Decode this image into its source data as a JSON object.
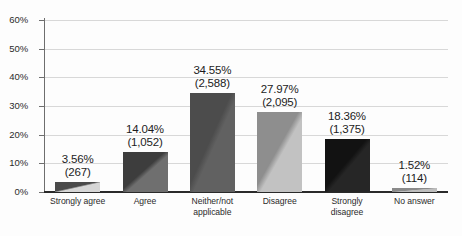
{
  "chart_data": {
    "type": "bar",
    "title": "",
    "subtitle": "",
    "xlabel": "",
    "ylabel": "",
    "ylim": [
      0,
      60
    ],
    "y_tick_labels": [
      "0%",
      "10%",
      "20%",
      "30%",
      "40%",
      "50%",
      "60%"
    ],
    "y_tick_values": [
      0,
      10,
      20,
      30,
      40,
      50,
      60
    ],
    "grid": true,
    "legend": "none",
    "categories": [
      "Strongly agree",
      "Agree",
      "Neither/not applicable",
      "Disagree",
      "Strongly disagree",
      "No answer"
    ],
    "values": [
      3.56,
      14.04,
      34.55,
      27.97,
      18.36,
      1.52
    ],
    "counts": [
      267,
      1052,
      2588,
      2095,
      1375,
      114
    ],
    "data_labels": [
      {
        "percent": "3.56%",
        "count": "(267)"
      },
      {
        "percent": "14.04%",
        "count": "(1,052)"
      },
      {
        "percent": "34.55%",
        "count": "(2,588)"
      },
      {
        "percent": "27.97%",
        "count": "(2,095)"
      },
      {
        "percent": "18.36%",
        "count": "(1,375)"
      },
      {
        "percent": "1.52%",
        "count": "(114)"
      }
    ],
    "category_label_lines": [
      [
        "Strongly agree"
      ],
      [
        "Agree"
      ],
      [
        "Neither/not",
        "applicable"
      ],
      [
        "Disagree"
      ],
      [
        "Strongly",
        "disagree"
      ],
      [
        "No answer"
      ]
    ],
    "bar_colors": [
      {
        "dark": "#4a4a4a",
        "light": "#d6d6d6"
      },
      {
        "dark": "#3d3d3d",
        "light": "#6f6f6f"
      },
      {
        "dark": "#4c4c4c",
        "light": "#616161"
      },
      {
        "dark": "#8e8e8e",
        "light": "#c2c2c2"
      },
      {
        "dark": "#121212",
        "light": "#262626"
      },
      {
        "dark": "#8a8a8a",
        "light": "#bdbdbd"
      }
    ],
    "axis_colors": {
      "gridline": "#d8d8d8",
      "baseline": "#2a2a2a",
      "axis": "#6e6e6e",
      "text": "#1c1c1c"
    }
  }
}
